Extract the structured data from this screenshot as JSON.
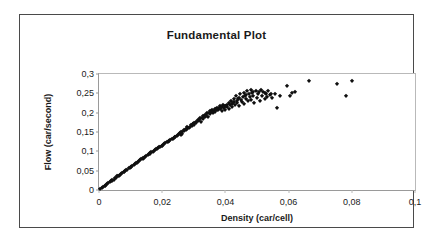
{
  "chart_data": {
    "type": "scatter",
    "title": "Fundamental Plot",
    "xlabel": "Density (car/cell)",
    "ylabel": "Flow (car/second)",
    "xlim": [
      0,
      0.1
    ],
    "ylim": [
      0,
      0.3
    ],
    "xticks": [
      0,
      0.02,
      0.04,
      0.06,
      0.08,
      0.1
    ],
    "xtick_labels": [
      "0",
      "0,02",
      "0,04",
      "0,06",
      "0,08",
      "0,1"
    ],
    "yticks": [
      0,
      0.05,
      0.1,
      0.15,
      0.2,
      0.25,
      0.3
    ],
    "ytick_labels": [
      "0",
      "0,05",
      "0,1",
      "0,15",
      "0,2",
      "0,25",
      "0,3"
    ],
    "grid": false,
    "legend": null,
    "marker": "diamond",
    "marker_color": "#101010",
    "decimal_separator": ",",
    "series": [
      {
        "name": "Flow vs Density",
        "points": [
          [
            0.0004,
            0.002
          ],
          [
            0.001,
            0.005
          ],
          [
            0.0014,
            0.008
          ],
          [
            0.0018,
            0.01
          ],
          [
            0.0022,
            0.013
          ],
          [
            0.0026,
            0.015
          ],
          [
            0.003,
            0.018
          ],
          [
            0.0034,
            0.02
          ],
          [
            0.0038,
            0.022
          ],
          [
            0.0042,
            0.025
          ],
          [
            0.0046,
            0.027
          ],
          [
            0.005,
            0.03
          ],
          [
            0.0054,
            0.032
          ],
          [
            0.0058,
            0.035
          ],
          [
            0.0062,
            0.037
          ],
          [
            0.0066,
            0.039
          ],
          [
            0.007,
            0.042
          ],
          [
            0.0074,
            0.044
          ],
          [
            0.0078,
            0.046
          ],
          [
            0.0082,
            0.049
          ],
          [
            0.0086,
            0.051
          ],
          [
            0.009,
            0.053
          ],
          [
            0.0094,
            0.056
          ],
          [
            0.0098,
            0.058
          ],
          [
            0.0102,
            0.06
          ],
          [
            0.0106,
            0.063
          ],
          [
            0.011,
            0.065
          ],
          [
            0.0114,
            0.067
          ],
          [
            0.0118,
            0.07
          ],
          [
            0.0122,
            0.072
          ],
          [
            0.0126,
            0.074
          ],
          [
            0.013,
            0.077
          ],
          [
            0.0134,
            0.079
          ],
          [
            0.0138,
            0.081
          ],
          [
            0.0142,
            0.084
          ],
          [
            0.0146,
            0.086
          ],
          [
            0.015,
            0.088
          ],
          [
            0.0154,
            0.09
          ],
          [
            0.0158,
            0.093
          ],
          [
            0.0162,
            0.095
          ],
          [
            0.0166,
            0.097
          ],
          [
            0.017,
            0.099
          ],
          [
            0.0174,
            0.101
          ],
          [
            0.0178,
            0.104
          ],
          [
            0.0182,
            0.106
          ],
          [
            0.0186,
            0.108
          ],
          [
            0.019,
            0.11
          ],
          [
            0.0194,
            0.112
          ],
          [
            0.0198,
            0.114
          ],
          [
            0.0202,
            0.117
          ],
          [
            0.0206,
            0.119
          ],
          [
            0.021,
            0.121
          ],
          [
            0.0214,
            0.123
          ],
          [
            0.0218,
            0.125
          ],
          [
            0.0222,
            0.127
          ],
          [
            0.0226,
            0.129
          ],
          [
            0.023,
            0.131
          ],
          [
            0.0234,
            0.133
          ],
          [
            0.0238,
            0.135
          ],
          [
            0.0242,
            0.137
          ],
          [
            0.0246,
            0.139
          ],
          [
            0.025,
            0.141
          ],
          [
            0.0252,
            0.146
          ],
          [
            0.0256,
            0.148
          ],
          [
            0.0258,
            0.143
          ],
          [
            0.0262,
            0.15
          ],
          [
            0.0264,
            0.145
          ],
          [
            0.0268,
            0.152
          ],
          [
            0.027,
            0.156
          ],
          [
            0.0274,
            0.154
          ],
          [
            0.0278,
            0.158
          ],
          [
            0.028,
            0.162
          ],
          [
            0.0284,
            0.16
          ],
          [
            0.0288,
            0.164
          ],
          [
            0.029,
            0.168
          ],
          [
            0.0294,
            0.166
          ],
          [
            0.0298,
            0.17
          ],
          [
            0.03,
            0.174
          ],
          [
            0.0302,
            0.169
          ],
          [
            0.0306,
            0.176
          ],
          [
            0.0308,
            0.172
          ],
          [
            0.0312,
            0.178
          ],
          [
            0.0314,
            0.182
          ],
          [
            0.0318,
            0.18
          ],
          [
            0.032,
            0.185
          ],
          [
            0.0322,
            0.177
          ],
          [
            0.0326,
            0.187
          ],
          [
            0.0328,
            0.183
          ],
          [
            0.033,
            0.191
          ],
          [
            0.0334,
            0.189
          ],
          [
            0.0336,
            0.195
          ],
          [
            0.034,
            0.193
          ],
          [
            0.0342,
            0.198
          ],
          [
            0.0344,
            0.19
          ],
          [
            0.0348,
            0.2
          ],
          [
            0.035,
            0.196
          ],
          [
            0.0352,
            0.204
          ],
          [
            0.0356,
            0.201
          ],
          [
            0.0358,
            0.207
          ],
          [
            0.036,
            0.199
          ],
          [
            0.0364,
            0.205
          ],
          [
            0.0366,
            0.21
          ],
          [
            0.0368,
            0.203
          ],
          [
            0.0372,
            0.208
          ],
          [
            0.0374,
            0.213
          ],
          [
            0.0376,
            0.206
          ],
          [
            0.038,
            0.211
          ],
          [
            0.0382,
            0.216
          ],
          [
            0.0384,
            0.209
          ],
          [
            0.0388,
            0.214
          ],
          [
            0.039,
            0.204
          ],
          [
            0.0392,
            0.219
          ],
          [
            0.0396,
            0.212
          ],
          [
            0.0398,
            0.217
          ],
          [
            0.04,
            0.207
          ],
          [
            0.0404,
            0.221
          ],
          [
            0.0406,
            0.215
          ],
          [
            0.041,
            0.224
          ],
          [
            0.0412,
            0.21
          ],
          [
            0.0414,
            0.219
          ],
          [
            0.0418,
            0.231
          ],
          [
            0.042,
            0.223
          ],
          [
            0.0422,
            0.214
          ],
          [
            0.0426,
            0.228
          ],
          [
            0.0428,
            0.236
          ],
          [
            0.043,
            0.22
          ],
          [
            0.0434,
            0.243
          ],
          [
            0.0436,
            0.23
          ],
          [
            0.0438,
            0.225
          ],
          [
            0.0442,
            0.239
          ],
          [
            0.0444,
            0.218
          ],
          [
            0.0446,
            0.247
          ],
          [
            0.045,
            0.233
          ],
          [
            0.0452,
            0.227
          ],
          [
            0.0456,
            0.241
          ],
          [
            0.0458,
            0.252
          ],
          [
            0.046,
            0.223
          ],
          [
            0.0464,
            0.245
          ],
          [
            0.0466,
            0.236
          ],
          [
            0.0468,
            0.257
          ],
          [
            0.0472,
            0.229
          ],
          [
            0.0474,
            0.249
          ],
          [
            0.0478,
            0.24
          ],
          [
            0.048,
            0.259
          ],
          [
            0.0482,
            0.232
          ],
          [
            0.0486,
            0.253
          ],
          [
            0.0488,
            0.244
          ],
          [
            0.0492,
            0.226
          ],
          [
            0.0496,
            0.256
          ],
          [
            0.05,
            0.238
          ],
          [
            0.0504,
            0.249
          ],
          [
            0.0508,
            0.231
          ],
          [
            0.0512,
            0.258
          ],
          [
            0.0516,
            0.242
          ],
          [
            0.052,
            0.253
          ],
          [
            0.0524,
            0.235
          ],
          [
            0.0528,
            0.247
          ],
          [
            0.0532,
            0.24
          ],
          [
            0.0536,
            0.256
          ],
          [
            0.054,
            0.245
          ],
          [
            0.0548,
            0.239
          ],
          [
            0.0556,
            0.248
          ],
          [
            0.0562,
            0.212
          ],
          [
            0.0572,
            0.243
          ],
          [
            0.0596,
            0.27
          ],
          [
            0.0604,
            0.244
          ],
          [
            0.0612,
            0.251
          ],
          [
            0.062,
            0.253
          ],
          [
            0.0664,
            0.283
          ],
          [
            0.0754,
            0.275
          ],
          [
            0.0782,
            0.243
          ],
          [
            0.08,
            0.283
          ],
          [
            0.002,
            0.011
          ],
          [
            0.004,
            0.023
          ],
          [
            0.006,
            0.036
          ],
          [
            0.008,
            0.047
          ],
          [
            0.01,
            0.059
          ],
          [
            0.012,
            0.071
          ],
          [
            0.014,
            0.082
          ],
          [
            0.016,
            0.094
          ],
          [
            0.018,
            0.105
          ],
          [
            0.02,
            0.115
          ],
          [
            0.022,
            0.126
          ],
          [
            0.024,
            0.138
          ],
          [
            0.026,
            0.149
          ],
          [
            0.0276,
            0.159
          ],
          [
            0.0296,
            0.171
          ],
          [
            0.0316,
            0.181
          ],
          [
            0.0338,
            0.192
          ],
          [
            0.0354,
            0.202
          ],
          [
            0.037,
            0.209
          ],
          [
            0.0386,
            0.213
          ],
          [
            0.0402,
            0.218
          ],
          [
            0.0424,
            0.226
          ],
          [
            0.044,
            0.235
          ],
          [
            0.0462,
            0.244
          ],
          [
            0.0484,
            0.25
          ],
          [
            0.0506,
            0.254
          ],
          [
            0.0526,
            0.251
          ],
          [
            0.0544,
            0.249
          ]
        ]
      }
    ]
  }
}
